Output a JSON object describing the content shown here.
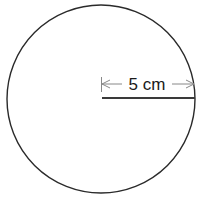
{
  "diagram": {
    "shape": "circle",
    "center": [
      101,
      98
    ],
    "radius_px": 94,
    "stroke_color": "#2a2a2a",
    "radius_line_color": "#3a3a3a",
    "dimension_color": "#888888",
    "radius_label": "5 cm"
  }
}
